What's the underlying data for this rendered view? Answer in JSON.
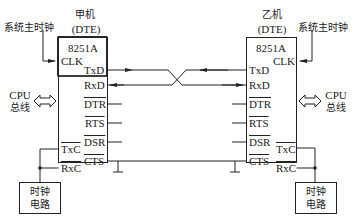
{
  "left_machine": {
    "title": "甲机",
    "subtitle": "(DTE)",
    "chip": "8251A",
    "clock_source": "系统主时钟",
    "cpu_bus": [
      "CPU",
      "总线"
    ],
    "clock_circuit": [
      "时钟",
      "电路"
    ],
    "pins_right": [
      "TxD",
      "RxD",
      "DTR",
      "RTS",
      "DSR",
      "CTS"
    ],
    "pins_left": [
      "CLK",
      "TxC",
      "RxC"
    ]
  },
  "right_machine": {
    "title": "乙机",
    "subtitle": "(DTE)",
    "chip": "8251A",
    "clock_source": "系统主时钟",
    "cpu_bus": [
      "CPU",
      "总线"
    ],
    "clock_circuit": [
      "时钟",
      "电路"
    ],
    "pins_left": [
      "TxD",
      "RxD",
      "DTR",
      "RTS",
      "DSR",
      "CTS"
    ],
    "pins_right": [
      "CLK",
      "TxC",
      "RxC"
    ]
  },
  "colors": {
    "line": "#222222",
    "background": "#ffffff"
  }
}
